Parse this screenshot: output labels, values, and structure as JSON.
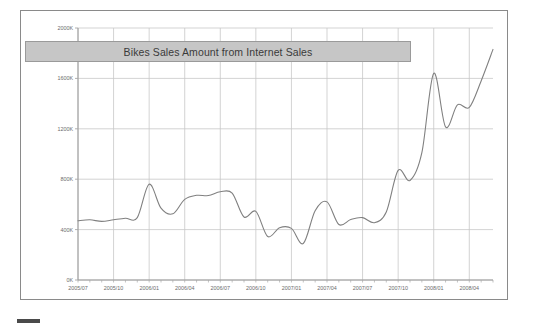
{
  "report": {
    "title": "Bikes Sales Amount from Internet Sales",
    "frame_border_color": "#8a8a8a",
    "title_banner_color": "#c6c6c6",
    "line_color": "#808080",
    "grid_color": "#c8c8c8"
  },
  "footer": {
    "marker_name": "resize-handle"
  },
  "chart_data": {
    "type": "line",
    "title": "Bikes Sales Amount from Internet Sales",
    "xlabel": "",
    "ylabel": "",
    "ylim": [
      0,
      2000
    ],
    "y_unit": "K",
    "grid": true,
    "legend": "none",
    "y_ticks": [
      "0K",
      "400K",
      "800K",
      "1200K",
      "1600K",
      "2000K"
    ],
    "y_tick_values": [
      0,
      400,
      800,
      1200,
      1600,
      2000
    ],
    "x_tick_labels": [
      "2005/07",
      "2005/10",
      "2006/01",
      "2006/04",
      "2006/07",
      "2006/10",
      "2007/01",
      "2007/04",
      "2007/07",
      "2007/10",
      "2008/01",
      "2008/04"
    ],
    "x": [
      "2005/07",
      "2005/08",
      "2005/09",
      "2005/10",
      "2005/11",
      "2005/12",
      "2006/01",
      "2006/02",
      "2006/03",
      "2006/04",
      "2006/05",
      "2006/06",
      "2006/07",
      "2006/08",
      "2006/09",
      "2006/10",
      "2006/11",
      "2006/12",
      "2007/01",
      "2007/02",
      "2007/03",
      "2007/04",
      "2007/05",
      "2007/06",
      "2007/07",
      "2007/08",
      "2007/09",
      "2007/10",
      "2007/11",
      "2007/12",
      "2008/01",
      "2008/02",
      "2008/03",
      "2008/04",
      "2008/05",
      "2008/06"
    ],
    "series": [
      {
        "name": "Bikes Sales Amount from Internet Sales",
        "values": [
          470,
          478,
          465,
          478,
          490,
          495,
          760,
          570,
          525,
          640,
          672,
          670,
          700,
          690,
          500,
          545,
          345,
          415,
          410,
          290,
          550,
          620,
          440,
          480,
          495,
          455,
          540,
          870,
          790,
          1010,
          1640,
          1215,
          1390,
          1370,
          1580,
          1830
        ]
      }
    ]
  }
}
